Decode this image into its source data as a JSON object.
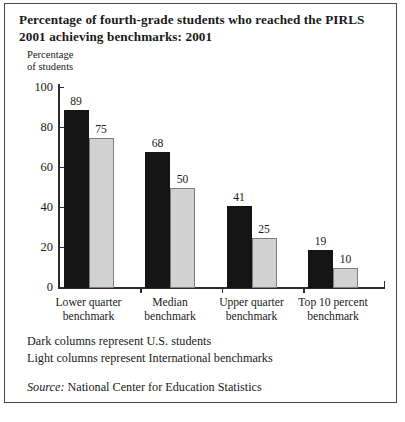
{
  "figure": {
    "title": "Percentage of fourth-grade students who reached the PIRLS 2001 achieving benchmarks: 2001",
    "notes": {
      "dark": "Dark columns represent U.S. students",
      "light": "Light columns represent International benchmarks"
    },
    "source": {
      "label": "Source:",
      "text": "National Center for Education Statistics"
    }
  },
  "chart_data": {
    "type": "bar",
    "title": "Percentage of fourth-grade students who reached the PIRLS 2001 achieving benchmarks: 2001",
    "xlabel": "",
    "ylabel": "Percentage\nof students",
    "ylim": [
      0,
      100
    ],
    "yticks": [
      0,
      20,
      40,
      60,
      80,
      100
    ],
    "ytick_labels": [
      "0",
      "20",
      "40",
      "60",
      "80",
      "100"
    ],
    "grid": false,
    "legend_position": "below-plot",
    "categories": [
      "Lower quarter\nbenchmark",
      "Median\nbenchmark",
      "Upper quarter\nbenchmark",
      "Top 10 percent\nbenchmark"
    ],
    "series": [
      {
        "name": "Dark columns represent U.S. students",
        "color": "#141414",
        "values": [
          89,
          68,
          41,
          19
        ],
        "value_labels": [
          "89",
          "68",
          "41",
          "19"
        ]
      },
      {
        "name": "Light columns represent International benchmarks",
        "color": "#d2d2d2",
        "values": [
          75,
          50,
          25,
          10
        ],
        "value_labels": [
          "75",
          "50",
          "25",
          "10"
        ]
      }
    ]
  }
}
